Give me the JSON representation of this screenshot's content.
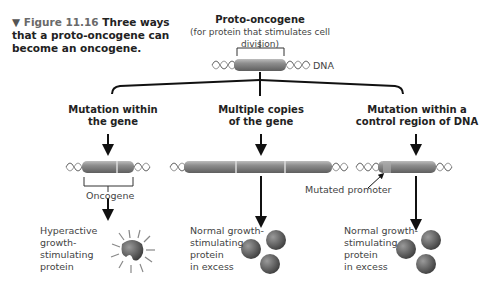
{
  "caption": {
    "marker": "▼",
    "figure": "Figure 11.16",
    "text": "Three ways that a proto-oncogene can become an oncogene."
  },
  "top": {
    "title": "Proto-oncogene",
    "subtitle": "(for protein that stimulates cell division)",
    "dna_label": "DNA"
  },
  "branches": [
    {
      "heading_line1": "Mutation within",
      "heading_line2": "the gene",
      "gene_label": "Oncogene",
      "result_lines": [
        "Hyperactive",
        "growth-",
        "stimulating",
        "protein"
      ]
    },
    {
      "heading_line1": "Multiple copies",
      "heading_line2": "of the gene",
      "result_lines": [
        "Normal growth-",
        "stimulating",
        "protein",
        "in excess"
      ]
    },
    {
      "heading_line1": "Mutation within a",
      "heading_line2": "control region of DNA",
      "pointer_label": "Mutated promoter",
      "result_lines": [
        "Normal growth-",
        "stimulating",
        "protein",
        "in excess"
      ]
    }
  ],
  "colors": {
    "gene_bar": "#8a8a8a",
    "gene_highlight": "#bdbdbd",
    "protein": "#6b6b6b",
    "line": "#111111"
  }
}
